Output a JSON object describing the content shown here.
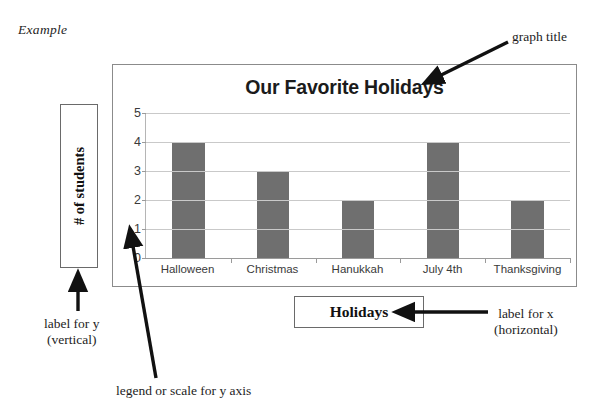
{
  "worksheet": {
    "example_label": "Example"
  },
  "chart_data": {
    "type": "bar",
    "title": "Our Favorite Holidays",
    "categories": [
      "Halloween",
      "Christmas",
      "Hanukkah",
      "July 4th",
      "Thanksgiving"
    ],
    "values": [
      4,
      3,
      2,
      4,
      2
    ],
    "xlabel": "Holidays",
    "ylabel": "# of students",
    "ylim": [
      0,
      5
    ],
    "yticks": [
      0,
      1,
      2,
      3,
      4,
      5
    ],
    "ytick_labels": [
      "0",
      "1",
      "2",
      "3",
      "4",
      "5"
    ],
    "grid": true,
    "legend": false,
    "bar_color": "#6f6f6f",
    "grid_color": "#c9c9c9",
    "axis_color": "#9a9a9a",
    "title_color": "#1b1b1b",
    "frame_color": "#8b8b8b"
  },
  "annotations": {
    "graph_title": "graph title",
    "label_for_y_line1": "label for y",
    "label_for_y_line2": "(vertical)",
    "label_for_x_line1": "label for x",
    "label_for_x_line2": "(horizontal)",
    "legend_scale_y": "legend or scale for y axis"
  }
}
